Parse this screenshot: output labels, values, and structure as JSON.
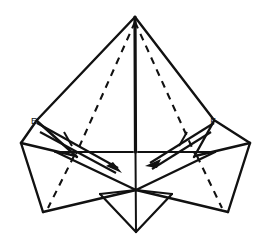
{
  "figure": {
    "kind": "origami-fold-diagram",
    "background_color": "#ffffff",
    "line_color": "#111111",
    "width": 271,
    "height": 249
  },
  "labels": [
    {
      "id": "E",
      "text": "E",
      "x": 36,
      "y": 121
    },
    {
      "id": "F",
      "text": "F",
      "x": 212,
      "y": 121
    }
  ],
  "arrows": [
    {
      "id": "left-fold-arrow",
      "name": "fold-arrow-left",
      "direction": "down-right",
      "from_x": 36,
      "from_y": 124,
      "to_x": 121,
      "to_y": 172,
      "has_tick": true
    },
    {
      "id": "right-fold-arrow",
      "name": "fold-arrow-right",
      "direction": "down-left",
      "from_x": 214,
      "from_y": 124,
      "to_x": 146,
      "to_y": 167,
      "has_tick": true
    }
  ],
  "solid_edges": [
    {
      "name": "apex-to-left-shoulder",
      "points": "135,17 37,120"
    },
    {
      "name": "apex-to-right-shoulder",
      "points": "135,17 214,120"
    },
    {
      "name": "center-vertical-spine",
      "points": "135,17 136,232"
    },
    {
      "name": "left-shoulder-to-left-wingtip",
      "points": "37,120 21,143"
    },
    {
      "name": "right-shoulder-to-right-wingtip",
      "points": "214,120 250,143"
    },
    {
      "name": "left-wingtip-to-mid-left",
      "points": "21,143 75,155"
    },
    {
      "name": "right-wingtip-to-mid-right",
      "points": "250,143 196,155"
    },
    {
      "name": "left-shoulder-to-mid-left",
      "points": "37,120 75,155"
    },
    {
      "name": "right-shoulder-to-mid-right",
      "points": "214,120 196,155"
    },
    {
      "name": "horizontal-left-segment",
      "points": "55,152 133,152"
    },
    {
      "name": "horizontal-right-segment",
      "points": "139,152 215,152"
    },
    {
      "name": "left-wingtip-down",
      "points": "21,143 43,212"
    },
    {
      "name": "right-wingtip-down",
      "points": "250,143 228,212"
    },
    {
      "name": "left-lower-edge",
      "points": "43,212 136,190"
    },
    {
      "name": "right-lower-edge",
      "points": "228,212 136,190"
    },
    {
      "name": "left-mid-to-center-bottom",
      "points": "55,152 136,190"
    },
    {
      "name": "right-mid-to-center-bottom",
      "points": "215,152 136,190"
    },
    {
      "name": "center-bottom-left-v",
      "points": "100,194 136,232"
    },
    {
      "name": "center-bottom-right-v",
      "points": "172,194 136,232"
    },
    {
      "name": "center-left-v-top",
      "points": "100,194 136,190"
    },
    {
      "name": "center-right-v-top",
      "points": "172,194 136,190"
    }
  ],
  "dashed_edges": [
    {
      "name": "left-crease-upper",
      "points": "135,20 75,155"
    },
    {
      "name": "left-crease-lower",
      "points": "75,155 48,208"
    },
    {
      "name": "right-crease-upper",
      "points": "135,20 196,155"
    },
    {
      "name": "right-crease-lower",
      "points": "196,155 222,208"
    }
  ]
}
